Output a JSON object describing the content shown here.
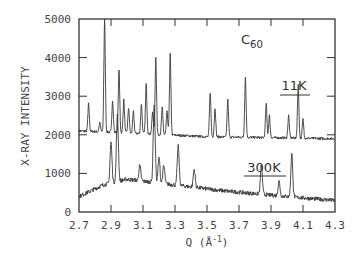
{
  "chart_data": {
    "type": "line",
    "title": "C60",
    "title_main": "C",
    "title_sub": "60",
    "xlabel": "Q (Å-1)",
    "xlabel_main": "Q (Å",
    "xlabel_sup": "-1",
    "xlabel_close": ")",
    "ylabel": "X-RAY INTENSITY",
    "xlim": [
      2.7,
      4.3
    ],
    "ylim": [
      0,
      5000
    ],
    "x_ticks": [
      "2.7",
      "2.9",
      "3.1",
      "3.3",
      "3.5",
      "3.7",
      "3.9",
      "4.1",
      "4.3"
    ],
    "y_ticks": [
      "0",
      "1000",
      "2000",
      "3000",
      "4000",
      "5000"
    ],
    "grid": false,
    "series": [
      {
        "name": "11K",
        "baseline": [
          [
            2.7,
            2100
          ],
          [
            3.0,
            2050
          ],
          [
            3.5,
            1950
          ],
          [
            4.3,
            1900
          ]
        ],
        "peaks": [
          {
            "q": 2.76,
            "intensity": 2800
          },
          {
            "q": 2.83,
            "intensity": 2300
          },
          {
            "q": 2.86,
            "intensity": 5000
          },
          {
            "q": 2.91,
            "intensity": 2900
          },
          {
            "q": 2.95,
            "intensity": 3700
          },
          {
            "q": 2.98,
            "intensity": 2900
          },
          {
            "q": 3.01,
            "intensity": 2700
          },
          {
            "q": 3.04,
            "intensity": 2600
          },
          {
            "q": 3.09,
            "intensity": 2800
          },
          {
            "q": 3.12,
            "intensity": 3300
          },
          {
            "q": 3.16,
            "intensity": 2600
          },
          {
            "q": 3.18,
            "intensity": 4000
          },
          {
            "q": 3.22,
            "intensity": 2700
          },
          {
            "q": 3.25,
            "intensity": 2600
          },
          {
            "q": 3.27,
            "intensity": 4100
          },
          {
            "q": 3.52,
            "intensity": 3100
          },
          {
            "q": 3.55,
            "intensity": 2700
          },
          {
            "q": 3.63,
            "intensity": 2900
          },
          {
            "q": 3.74,
            "intensity": 3500
          },
          {
            "q": 3.87,
            "intensity": 2800
          },
          {
            "q": 3.89,
            "intensity": 2500
          },
          {
            "q": 4.01,
            "intensity": 2500
          },
          {
            "q": 4.07,
            "intensity": 3300
          },
          {
            "q": 4.1,
            "intensity": 2400
          }
        ],
        "label": "11K"
      },
      {
        "name": "300K",
        "baseline": [
          [
            2.7,
            400
          ],
          [
            2.85,
            700
          ],
          [
            3.0,
            850
          ],
          [
            3.3,
            700
          ],
          [
            3.6,
            550
          ],
          [
            4.0,
            400
          ],
          [
            4.3,
            300
          ]
        ],
        "peaks": [
          {
            "q": 2.9,
            "intensity": 1800
          },
          {
            "q": 2.94,
            "intensity": 2500
          },
          {
            "q": 3.08,
            "intensity": 1200
          },
          {
            "q": 3.17,
            "intensity": 2800
          },
          {
            "q": 3.2,
            "intensity": 1400
          },
          {
            "q": 3.23,
            "intensity": 1200
          },
          {
            "q": 3.32,
            "intensity": 1700
          },
          {
            "q": 3.42,
            "intensity": 1100
          },
          {
            "q": 3.84,
            "intensity": 1200
          },
          {
            "q": 3.95,
            "intensity": 800
          },
          {
            "q": 4.03,
            "intensity": 1500
          }
        ],
        "label": "300K"
      }
    ],
    "annotations": [
      {
        "text": "C60",
        "q": 3.82,
        "intensity": 4550
      },
      {
        "text": "11K",
        "q": 4.02,
        "intensity": 2950
      },
      {
        "text": "300K",
        "q": 3.73,
        "intensity": 1000
      }
    ]
  },
  "labels": {
    "series1": "11K",
    "series2": "300K"
  }
}
